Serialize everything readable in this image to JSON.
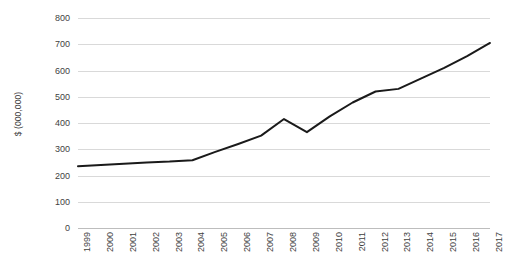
{
  "chart_data": {
    "type": "line",
    "title": "",
    "subtitle": "",
    "xlabel": "",
    "ylabel": "$ (000,000)",
    "ylim": [
      0,
      800
    ],
    "ytick_interval": 100,
    "yticks": [
      0,
      100,
      200,
      300,
      400,
      500,
      600,
      700,
      800
    ],
    "ytick_labels": [
      "0",
      "100",
      "200",
      "300",
      "400",
      "500",
      "600",
      "700",
      "800"
    ],
    "grid": true,
    "grid_axis": "y",
    "legend": false,
    "legend_position": "none",
    "categories": [
      "1999",
      "2000",
      "2001",
      "2002",
      "2003",
      "2004",
      "2005",
      "2006",
      "2007",
      "2008",
      "2009",
      "2010",
      "2011",
      "2012",
      "2013",
      "2014",
      "2015",
      "2016",
      "2017"
    ],
    "x": [
      1999,
      2000,
      2001,
      2002,
      2003,
      2004,
      2005,
      2006,
      2007,
      2008,
      2009,
      2010,
      2011,
      2012,
      2013,
      2014,
      2015,
      2016,
      2017
    ],
    "values": [
      235,
      240,
      245,
      250,
      253,
      258,
      290,
      320,
      352,
      415,
      365,
      425,
      478,
      520,
      530,
      570,
      610,
      655,
      705
    ],
    "series": [
      {
        "name": "Revenue",
        "color": "#1a1a1a",
        "line_width": 2,
        "markers": false,
        "values": [
          235,
          240,
          245,
          250,
          253,
          258,
          290,
          320,
          352,
          415,
          365,
          425,
          478,
          520,
          530,
          570,
          610,
          655,
          705
        ]
      }
    ],
    "colors": {
      "line": "#1a1a1a",
      "gridline": "#d9d9d9",
      "baseline": "#bdbdbd",
      "background": "#ffffff",
      "text": "#3f3f3f"
    },
    "annotations": []
  }
}
